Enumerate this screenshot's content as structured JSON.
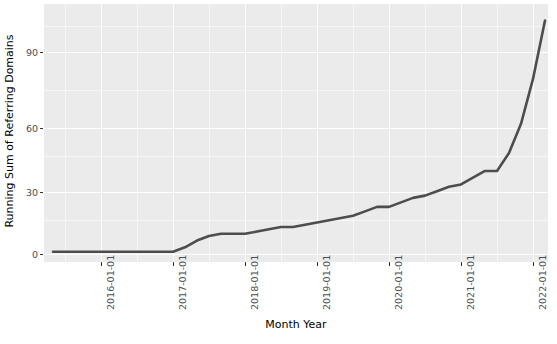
{
  "chart_data": {
    "type": "line",
    "title": "",
    "xlabel": "Month Year",
    "ylabel": "Running Sum of Referring Domains",
    "ylim": [
      -3,
      112
    ],
    "yticks": [
      0,
      30,
      60,
      90
    ],
    "ytick_labels": [
      "0",
      "30",
      "60",
      "90"
    ],
    "xticks": [
      "2016-01-01",
      "2017-01-01",
      "2018-01-01",
      "2019-01-01",
      "2020-01-01",
      "2021-01-01",
      "2022-01-01"
    ],
    "xtick_labels": [
      "2016-01-01",
      "2017-01-01",
      "2018-01-01",
      "2019-01-01",
      "2020-01-01",
      "2021-01-01",
      "2022-01-01"
    ],
    "grid": true,
    "legend": "none",
    "line_color": "#4d4d4d",
    "panel_color": "#ebebeb",
    "gridline_color": "#ffffff",
    "series": [
      {
        "name": "Running Sum of Referring Domains",
        "x": [
          "2015-05-01",
          "2015-07-01",
          "2015-09-01",
          "2015-11-01",
          "2016-01-01",
          "2016-03-01",
          "2016-05-01",
          "2016-07-01",
          "2016-09-01",
          "2016-11-01",
          "2017-01-01",
          "2017-03-01",
          "2017-05-01",
          "2017-07-01",
          "2017-09-01",
          "2017-11-01",
          "2018-01-01",
          "2018-03-01",
          "2018-05-01",
          "2018-07-01",
          "2018-09-01",
          "2018-11-01",
          "2019-01-01",
          "2019-03-01",
          "2019-05-01",
          "2019-07-01",
          "2019-09-01",
          "2019-11-01",
          "2020-01-01",
          "2020-03-01",
          "2020-05-01",
          "2020-07-01",
          "2020-09-01",
          "2020-11-01",
          "2021-01-01",
          "2021-03-01",
          "2021-05-01",
          "2021-07-01",
          "2021-09-01",
          "2021-11-01",
          "2022-01-01",
          "2022-03-01"
        ],
        "values": [
          1,
          1,
          1,
          1,
          1,
          1,
          1,
          1,
          1,
          1,
          1,
          3,
          6,
          8,
          9,
          9,
          9,
          10,
          11,
          12,
          12,
          13,
          14,
          15,
          16,
          17,
          19,
          21,
          21,
          23,
          25,
          26,
          28,
          30,
          31,
          34,
          37,
          37,
          45,
          58,
          78,
          104
        ]
      }
    ]
  },
  "axis": {
    "y_title": "Running Sum of Referring Domains",
    "x_title": "Month Year"
  }
}
